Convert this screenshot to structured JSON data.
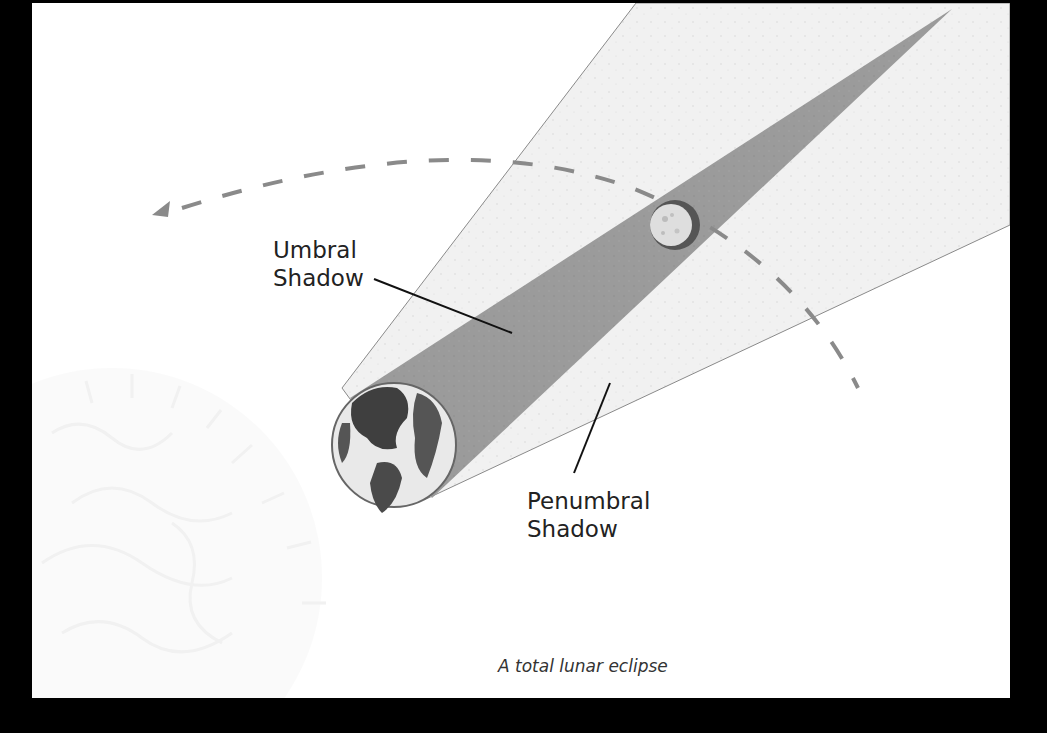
{
  "figure": {
    "labels": {
      "umbral": "Umbral\nShadow",
      "penumbral": "Penumbral\nShadow"
    },
    "caption": "A total lunar eclipse",
    "objects": [
      "sun-icon",
      "earth-icon",
      "moon-icon",
      "orbit-arrow"
    ],
    "colors": {
      "umbra": "#9a9a9a",
      "penumbra": "#efefef",
      "orbit": "#8a8a8a",
      "frame": "#000000",
      "background": "#ffffff"
    }
  }
}
